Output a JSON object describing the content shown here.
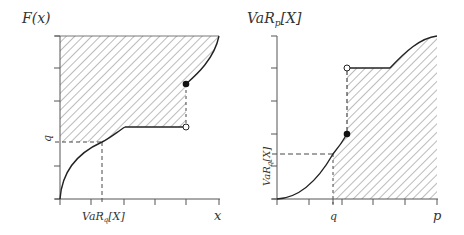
{
  "left_plot": {
    "y_label": "F(x)",
    "x_label": "x",
    "x_marker_label": "VaR_q[X]",
    "x_marker_main": "VaR",
    "x_marker_sub": "q",
    "x_marker_tail": "[X]",
    "y_marker_label": "q"
  },
  "right_plot": {
    "y_label": "VaR_p[X]",
    "y_label_main": "VaR",
    "y_label_sub": "p",
    "y_label_tail": "[X]",
    "x_label": "p",
    "x_marker_label": "q",
    "y_marker_label": "VaR_q[X]",
    "y_marker_main": "VaR",
    "y_marker_sub": "q",
    "y_marker_tail": "[X]"
  },
  "colors": {
    "line": "#222222",
    "axis": "#555555",
    "hatch": "#555555",
    "text": "#333333"
  }
}
